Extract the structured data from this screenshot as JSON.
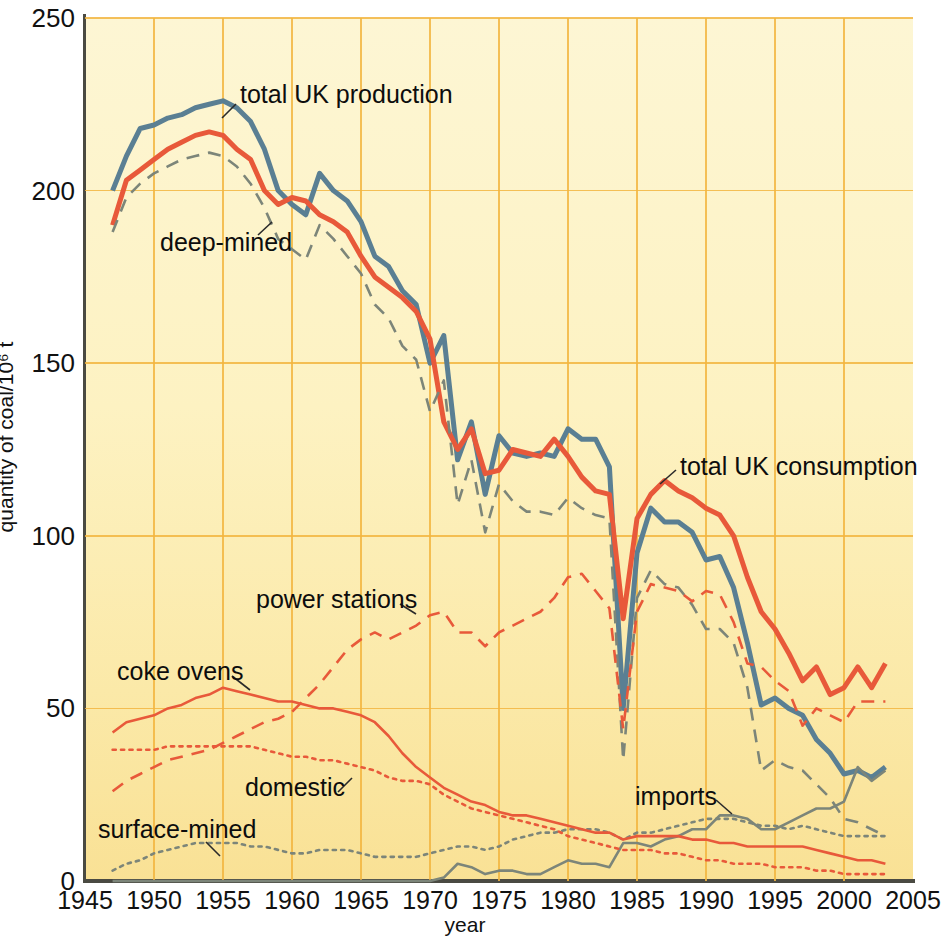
{
  "axes": {
    "y_title": "quantity of coal/10⁶ t",
    "x_title": "year",
    "y_ticks": [
      "0",
      "50",
      "100",
      "150",
      "200",
      "250"
    ],
    "x_ticks": [
      "1945",
      "1950",
      "1955",
      "1960",
      "1965",
      "1970",
      "1975",
      "1980",
      "1985",
      "1990",
      "1995",
      "2000",
      "2005"
    ]
  },
  "annotations": {
    "total_production": "total UK production",
    "deep_mined": "deep-mined",
    "total_consumption": "total UK consumption",
    "power_stations": "power stations",
    "coke_ovens": "coke ovens",
    "domestic": "domestic",
    "surface_mined": "surface-mined",
    "imports": "imports"
  },
  "colors": {
    "background_top": "#fdf6d4",
    "background_bottom": "#f9e195",
    "gridline": "#f2b53f",
    "blue": "#5a7f93",
    "red": "#e8593a",
    "grey": "#7c8579",
    "axis": "#4a4a42"
  },
  "chart_data": {
    "type": "line",
    "title": "",
    "xlabel": "year",
    "ylabel": "quantity of coal/10⁶ t",
    "xlim": [
      1945,
      2005
    ],
    "ylim": [
      0,
      250
    ],
    "grid": true,
    "legend": "inline annotations",
    "x": [
      1947,
      1948,
      1949,
      1950,
      1951,
      1952,
      1953,
      1954,
      1955,
      1956,
      1957,
      1958,
      1959,
      1960,
      1961,
      1962,
      1963,
      1964,
      1965,
      1966,
      1967,
      1968,
      1969,
      1970,
      1971,
      1972,
      1973,
      1974,
      1975,
      1976,
      1977,
      1978,
      1979,
      1980,
      1981,
      1982,
      1983,
      1984,
      1985,
      1986,
      1987,
      1988,
      1989,
      1990,
      1991,
      1992,
      1993,
      1994,
      1995,
      1996,
      1997,
      1998,
      1999,
      2000,
      2001,
      2002,
      2003
    ],
    "series": [
      {
        "name": "total UK production",
        "style": "solid",
        "color": "#5a7f93",
        "width": "thick",
        "values": [
          200,
          210,
          218,
          219,
          221,
          222,
          224,
          225,
          226,
          224,
          220,
          212,
          200,
          196,
          193,
          205,
          200,
          197,
          191,
          181,
          178,
          171,
          167,
          150,
          158,
          122,
          133,
          112,
          129,
          124,
          123,
          124,
          123,
          131,
          128,
          128,
          120,
          50,
          95,
          108,
          104,
          104,
          101,
          93,
          94,
          85,
          69,
          51,
          53,
          50,
          48,
          41,
          37,
          31,
          32,
          30,
          33
        ]
      },
      {
        "name": "total UK consumption",
        "style": "solid",
        "color": "#e8593a",
        "width": "thick",
        "values": [
          190,
          203,
          206,
          209,
          212,
          214,
          216,
          217,
          216,
          212,
          209,
          200,
          196,
          198,
          197,
          193,
          191,
          188,
          181,
          175,
          172,
          169,
          165,
          157,
          133,
          125,
          131,
          118,
          119,
          125,
          124,
          123,
          128,
          123,
          117,
          113,
          112,
          76,
          105,
          112,
          116,
          113,
          111,
          108,
          106,
          100,
          88,
          78,
          73,
          66,
          58,
          62,
          54,
          56,
          62,
          56,
          63
        ]
      },
      {
        "name": "deep-mined",
        "style": "dashed",
        "color": "#7c8579",
        "width": "thin",
        "values": [
          188,
          198,
          202,
          205,
          207,
          209,
          210,
          211,
          210,
          207,
          202,
          195,
          186,
          183,
          180,
          190,
          186,
          181,
          176,
          167,
          163,
          155,
          151,
          136,
          145,
          109,
          122,
          101,
          115,
          110,
          107,
          107,
          106,
          111,
          108,
          106,
          105,
          35,
          82,
          90,
          86,
          85,
          80,
          73,
          73,
          69,
          56,
          32,
          35,
          33,
          32,
          28,
          24,
          18,
          17,
          15,
          13
        ]
      },
      {
        "name": "surface-mined",
        "style": "dotted",
        "color": "#7c8579",
        "width": "thin",
        "values": [
          3,
          5,
          6,
          8,
          9,
          10,
          11,
          11,
          11,
          11,
          10,
          10,
          9,
          8,
          8,
          9,
          9,
          9,
          8,
          7,
          7,
          7,
          7,
          8,
          9,
          10,
          10,
          9,
          10,
          12,
          13,
          14,
          14,
          15,
          15,
          15,
          14,
          12,
          14,
          14,
          15,
          16,
          17,
          18,
          18,
          18,
          17,
          16,
          16,
          15,
          16,
          15,
          14,
          13,
          13,
          13,
          13
        ]
      },
      {
        "name": "imports",
        "style": "solid",
        "color": "#7c8579",
        "width": "thin",
        "values": [
          0,
          0,
          0,
          0,
          0,
          0,
          0,
          0,
          0,
          0,
          0,
          0,
          0,
          0,
          0,
          0,
          0,
          0,
          0,
          0,
          0,
          0,
          0,
          0,
          1,
          5,
          4,
          2,
          3,
          3,
          2,
          2,
          4,
          6,
          5,
          5,
          4,
          11,
          11,
          10,
          12,
          13,
          15,
          15,
          19,
          19,
          18,
          15,
          15,
          17,
          19,
          21,
          21,
          23,
          33,
          29,
          32
        ]
      },
      {
        "name": "power stations",
        "style": "dashed",
        "color": "#e8593a",
        "width": "thin",
        "values": [
          26,
          29,
          31,
          33,
          35,
          36,
          37,
          38,
          40,
          42,
          44,
          46,
          47,
          49,
          53,
          57,
          62,
          67,
          70,
          72,
          70,
          72,
          74,
          77,
          78,
          72,
          72,
          68,
          72,
          74,
          76,
          78,
          82,
          88,
          89,
          84,
          79,
          44,
          78,
          86,
          85,
          84,
          81,
          84,
          83,
          75,
          63,
          62,
          58,
          55,
          45,
          50,
          48,
          46,
          52,
          52,
          52
        ]
      },
      {
        "name": "coke ovens",
        "style": "solid",
        "color": "#e8593a",
        "width": "thin",
        "values": [
          43,
          46,
          47,
          48,
          50,
          51,
          53,
          54,
          56,
          55,
          54,
          53,
          52,
          52,
          51,
          50,
          50,
          49,
          48,
          46,
          42,
          37,
          33,
          30,
          27,
          25,
          23,
          22,
          20,
          19,
          19,
          18,
          17,
          16,
          15,
          14,
          14,
          12,
          13,
          13,
          13,
          13,
          12,
          12,
          11,
          11,
          10,
          10,
          10,
          10,
          10,
          9,
          8,
          7,
          6,
          6,
          5
        ]
      },
      {
        "name": "domestic",
        "style": "dotted",
        "color": "#e8593a",
        "width": "thin",
        "values": [
          38,
          38,
          38,
          38,
          39,
          39,
          39,
          39,
          39,
          39,
          39,
          38,
          37,
          36,
          36,
          35,
          35,
          34,
          33,
          32,
          30,
          29,
          29,
          28,
          25,
          23,
          21,
          20,
          19,
          18,
          17,
          16,
          15,
          13,
          12,
          11,
          10,
          9,
          9,
          9,
          8,
          8,
          7,
          6,
          6,
          5,
          5,
          5,
          4,
          4,
          4,
          3,
          3,
          2,
          2,
          2,
          2
        ]
      }
    ]
  }
}
